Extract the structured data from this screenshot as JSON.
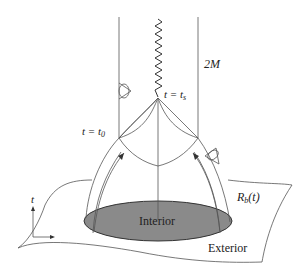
{
  "diagram": {
    "labels": {
      "horizon_radius": "2M",
      "singularity_time": "t = t",
      "singularity_time_sub": "s",
      "initial_time": "t = t",
      "initial_time_sub": "0",
      "boundary": "R",
      "boundary_sub": "b",
      "boundary_arg": "(t)",
      "interior": "Interior",
      "exterior": "Exterior",
      "time_axis": "t"
    },
    "colors": {
      "interior_fill": "#8a8a8a",
      "lines": "#555555",
      "background": "#ffffff"
    }
  }
}
